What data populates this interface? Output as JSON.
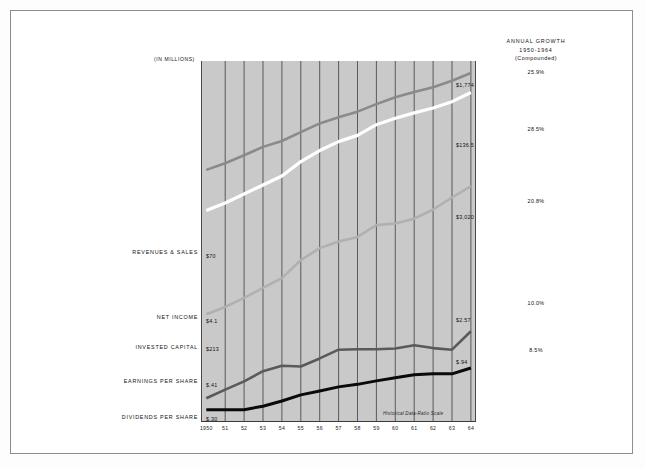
{
  "figure": {
    "units_label": "(IN MILLIONS)",
    "scale_note": "Historical Data-Ratio Scale",
    "growth_header_line1": "ANNUAL GROWTH",
    "growth_header_line2": "1950-1964",
    "growth_header_line3": "(Compounded)"
  },
  "chart_data": {
    "type": "line",
    "title": "",
    "subtitle": "",
    "xlabel": "",
    "ylabel": "(IN MILLIONS)",
    "scale": "log",
    "grid": "vertical",
    "legend_position": "left-and-right-inline",
    "annotations": [
      "Historical Data-Ratio Scale"
    ],
    "x": [
      "1950",
      "51",
      "52",
      "53",
      "54",
      "55",
      "56",
      "57",
      "58",
      "59",
      "60",
      "61",
      "62",
      "63",
      "64"
    ],
    "tick_labels": [
      "1950",
      "51",
      "52",
      "53",
      "54",
      "55",
      "56",
      "57",
      "58",
      "59",
      "60",
      "61",
      "62",
      "63",
      "64"
    ],
    "series": [
      {
        "name": "REVENUES & SALES",
        "color": "#ffffff",
        "start_label": "$70",
        "end_label": "$1,774",
        "growth": "25.9%",
        "values": [
          70,
          86,
          110,
          141,
          180,
          267,
          362,
          462,
          548,
          735,
          875,
          1015,
          1160,
          1380,
          1774
        ]
      },
      {
        "name": "NET INCOME",
        "color": "#b0b0b0",
        "start_label": "$4.1",
        "end_label": "$136.5",
        "growth": "28.5%",
        "values": [
          4.1,
          5.0,
          6.4,
          8.4,
          11.0,
          18.0,
          25.0,
          30.0,
          34.0,
          47.0,
          49.0,
          56.0,
          72.0,
          100.0,
          136.5
        ]
      },
      {
        "name": "INVESTED CAPITAL",
        "color": "#8a8a8a",
        "start_label": "$213",
        "end_label": "$3,020",
        "growth": "20.8%",
        "values": [
          213,
          255,
          318,
          400,
          470,
          600,
          760,
          900,
          1050,
          1290,
          1560,
          1800,
          2050,
          2450,
          3020
        ]
      },
      {
        "name": "EARNINGS PER SHARE",
        "color": "#5a5a5a",
        "start_label": "$.41",
        "end_label": "$2.57",
        "growth": "10.0%",
        "values": [
          0.41,
          0.52,
          0.65,
          0.86,
          1.0,
          0.98,
          1.22,
          1.55,
          1.57,
          1.57,
          1.6,
          1.75,
          1.62,
          1.55,
          2.57
        ]
      },
      {
        "name": "DIVIDENDS PER SHARE",
        "color": "#0a0a0a",
        "start_label": "$.30",
        "end_label": "$.94",
        "growth": "8.5%",
        "values": [
          0.3,
          0.3,
          0.3,
          0.33,
          0.38,
          0.45,
          0.5,
          0.56,
          0.6,
          0.66,
          0.72,
          0.78,
          0.8,
          0.8,
          0.94
        ]
      }
    ]
  },
  "left_labels": [
    {
      "text": "REVENUES & SALES",
      "top": 238
    },
    {
      "text": "NET INCOME",
      "top": 303
    },
    {
      "text": "INVESTED CAPITAL",
      "top": 333
    },
    {
      "text": "EARNINGS PER SHARE",
      "top": 367
    },
    {
      "text": "DIVIDENDS PER SHARE",
      "top": 403
    }
  ],
  "start_values": [
    {
      "text": "$70",
      "left": 5,
      "top": 192
    },
    {
      "text": "$4.1",
      "left": 5,
      "top": 257
    },
    {
      "text": "$213",
      "left": 5,
      "top": 285
    },
    {
      "text": "$.41",
      "left": 5,
      "top": 321
    },
    {
      "text": "$.30",
      "left": 5,
      "top": 355
    }
  ],
  "end_values": [
    {
      "text": "$1,774",
      "left": 255,
      "top": 21
    },
    {
      "text": "$136.5",
      "left": 255,
      "top": 81
    },
    {
      "text": "$3,020",
      "left": 255,
      "top": 153
    },
    {
      "text": "$2.57",
      "left": 255,
      "top": 256
    },
    {
      "text": "$.94",
      "left": 255,
      "top": 298
    }
  ],
  "growth_values": [
    {
      "text": "25.9%",
      "top": 32
    },
    {
      "text": "28.5%",
      "top": 89
    },
    {
      "text": "20.8%",
      "top": 161
    },
    {
      "text": "10.0%",
      "top": 263
    },
    {
      "text": "8.5%",
      "top": 310
    }
  ]
}
